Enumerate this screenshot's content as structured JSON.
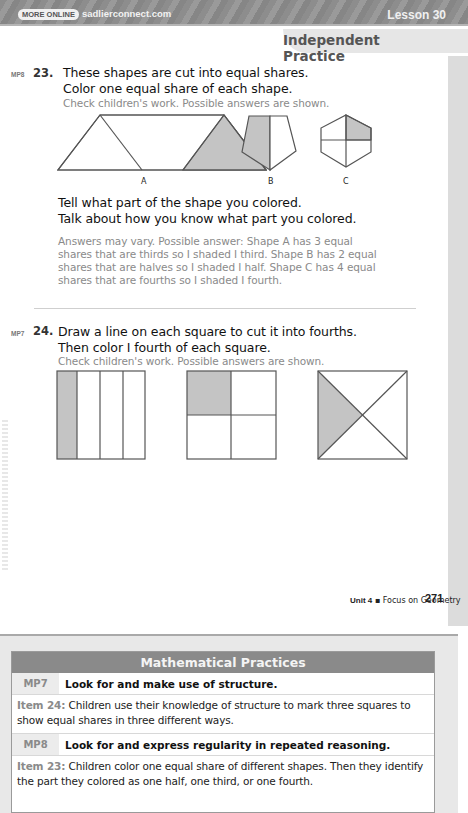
{
  "header": {
    "more_online": "MORE ONLINE",
    "url": "sadlierconnect.com",
    "lesson": "Lesson 30",
    "section": "Independent Practice"
  },
  "q23": {
    "mp": "MP8",
    "number": "23.",
    "lines": [
      "These shapes are cut into equal shares.",
      "Color one equal share of each shape."
    ],
    "hint": "Check children's work. Possible answers are shown.",
    "shape_labels": [
      "A",
      "B",
      "C"
    ],
    "followup": [
      "Tell what part of the shape you colored.",
      "Talk about how you know what part you colored."
    ],
    "answer": [
      "Answers may vary. Possible answer: Shape A has 3 equal",
      "shares that are thirds so I shaded  I  third. Shape B has 2 equal",
      "shares that are halves so I shaded  I  half. Shape C has 4 equal",
      "shares that are fourths so I shaded  I  fourth."
    ]
  },
  "q24": {
    "mp": "MP7",
    "number": "24.",
    "lines": [
      "Draw a line on each square to cut it into fourths.",
      "Then color  I  fourth of each square."
    ],
    "hint": "Check children's work. Possible answers are shown."
  },
  "footer": {
    "unit": "Unit 4",
    "separator": " ▪ ",
    "topic": "Focus on Geometry",
    "page": "271"
  },
  "colors": {
    "shade": "#c4c4c4",
    "answer_text": "#8a8a8a",
    "panel_header": "#8a8a8a"
  },
  "practices": {
    "title": "Mathematical Practices",
    "rows": [
      {
        "code": "MP7",
        "title": "Look for and make use of structure.",
        "item": "Item 24:",
        "desc": "Children use their knowledge of structure to mark three squares to show equal shares in three different ways."
      },
      {
        "code": "MP8",
        "title": "Look for and express regularity in repeated reasoning.",
        "item": "Item 23:",
        "desc": "Children color one equal share of different shapes. Then they identify the part they colored as one half, one third, or one fourth."
      }
    ]
  }
}
